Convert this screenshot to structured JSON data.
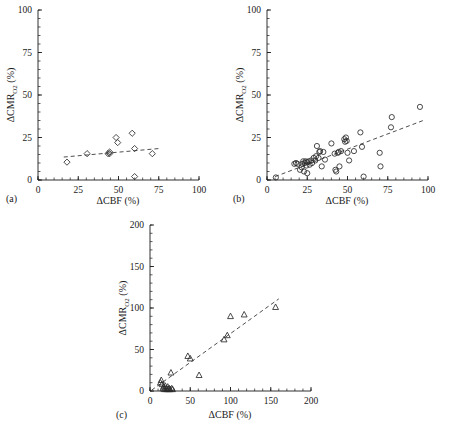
{
  "figure": {
    "background": "#ffffff",
    "ink": "#1a1a1a",
    "marker_color": "#2b2b2b",
    "trend_color": "#3a3a3a"
  },
  "panels": [
    {
      "tag": "(a)",
      "xlabel_main": "ΔCBF (%)",
      "ylabel_main": "ΔCMR",
      "ylabel_sub": "O2",
      "ylabel_unit": " (%)",
      "xticks": [
        "0",
        "25",
        "50",
        "75",
        "100"
      ],
      "yticks": [
        "0",
        "25",
        "50",
        "75",
        "100"
      ]
    },
    {
      "tag": "(b)",
      "xlabel_main": "ΔCBF (%)",
      "ylabel_main": "ΔCMR",
      "ylabel_sub": "O2",
      "ylabel_unit": " (%)",
      "xticks": [
        "0",
        "25",
        "50",
        "75",
        "100"
      ],
      "yticks": [
        "0",
        "25",
        "50",
        "75",
        "100"
      ]
    },
    {
      "tag": "(c)",
      "xlabel_main": "ΔCBF (%)",
      "ylabel_main": "ΔCMR",
      "ylabel_sub": "O2",
      "ylabel_unit": " (%)",
      "xticks": [
        "0",
        "50",
        "100",
        "150",
        "200"
      ],
      "yticks": [
        "0",
        "50",
        "100",
        "150",
        "200"
      ]
    }
  ],
  "chart_data": [
    {
      "type": "scatter",
      "panel": "a",
      "title": "",
      "xlabel": "ΔCBF (%)",
      "ylabel": "ΔCMR_O2 (%)",
      "xlim": [
        0,
        100
      ],
      "ylim": [
        0,
        100
      ],
      "xticks": [
        0,
        25,
        50,
        75,
        100
      ],
      "yticks": [
        0,
        25,
        50,
        75,
        100
      ],
      "grid": false,
      "legend": "none",
      "marker": "diamond",
      "points": [
        {
          "x": 18,
          "y": 10.5
        },
        {
          "x": 30.5,
          "y": 15.5
        },
        {
          "x": 43.5,
          "y": 15.5
        },
        {
          "x": 44.5,
          "y": 15.5
        },
        {
          "x": 44.5,
          "y": 16.5
        },
        {
          "x": 48.5,
          "y": 25
        },
        {
          "x": 49.5,
          "y": 22
        },
        {
          "x": 58.5,
          "y": 27.5
        },
        {
          "x": 60,
          "y": 18.5
        },
        {
          "x": 60,
          "y": 2
        },
        {
          "x": 71,
          "y": 15.5
        }
      ],
      "trendline": {
        "x0": 16,
        "y0": 13.5,
        "x1": 75,
        "y1": 18.5,
        "style": "dashed"
      }
    },
    {
      "type": "scatter",
      "panel": "b",
      "title": "",
      "xlabel": "ΔCBF (%)",
      "ylabel": "ΔCMR_O2 (%)",
      "xlim": [
        0,
        100
      ],
      "ylim": [
        0,
        100
      ],
      "xticks": [
        0,
        25,
        50,
        75,
        100
      ],
      "yticks": [
        0,
        25,
        50,
        75,
        100
      ],
      "grid": false,
      "legend": "none",
      "marker": "circle",
      "points": [
        {
          "x": 5.5,
          "y": 1.5
        },
        {
          "x": 17,
          "y": 9.5
        },
        {
          "x": 18,
          "y": 10
        },
        {
          "x": 19,
          "y": 9.5
        },
        {
          "x": 20.5,
          "y": 6
        },
        {
          "x": 21.5,
          "y": 7.5
        },
        {
          "x": 22,
          "y": 9.5
        },
        {
          "x": 22.5,
          "y": 11
        },
        {
          "x": 23,
          "y": 5
        },
        {
          "x": 23.5,
          "y": 10
        },
        {
          "x": 24,
          "y": 11
        },
        {
          "x": 24.5,
          "y": 8.5
        },
        {
          "x": 25,
          "y": 10.5
        },
        {
          "x": 25,
          "y": 4
        },
        {
          "x": 26,
          "y": 11
        },
        {
          "x": 26.5,
          "y": 9
        },
        {
          "x": 27.5,
          "y": 11.5
        },
        {
          "x": 28,
          "y": 10
        },
        {
          "x": 29,
          "y": 13
        },
        {
          "x": 30,
          "y": 11.5
        },
        {
          "x": 30.5,
          "y": 14
        },
        {
          "x": 31,
          "y": 20
        },
        {
          "x": 32,
          "y": 13
        },
        {
          "x": 32.5,
          "y": 16.5
        },
        {
          "x": 33,
          "y": 17
        },
        {
          "x": 34,
          "y": 8
        },
        {
          "x": 35,
          "y": 16.5
        },
        {
          "x": 36,
          "y": 12
        },
        {
          "x": 40,
          "y": 21.5
        },
        {
          "x": 42,
          "y": 15.5
        },
        {
          "x": 42.5,
          "y": 6
        },
        {
          "x": 43,
          "y": 5
        },
        {
          "x": 44,
          "y": 16
        },
        {
          "x": 44.5,
          "y": 16.5
        },
        {
          "x": 45,
          "y": 8
        },
        {
          "x": 46,
          "y": 17
        },
        {
          "x": 48,
          "y": 24
        },
        {
          "x": 48.5,
          "y": 22.5
        },
        {
          "x": 49,
          "y": 25
        },
        {
          "x": 49.5,
          "y": 23
        },
        {
          "x": 50,
          "y": 16
        },
        {
          "x": 51,
          "y": 11.5
        },
        {
          "x": 54,
          "y": 17
        },
        {
          "x": 58,
          "y": 28
        },
        {
          "x": 59,
          "y": 19.5
        },
        {
          "x": 60,
          "y": 2
        },
        {
          "x": 70,
          "y": 16
        },
        {
          "x": 70.5,
          "y": 8
        },
        {
          "x": 77,
          "y": 31
        },
        {
          "x": 77.5,
          "y": 37
        },
        {
          "x": 95,
          "y": 43
        }
      ],
      "trendline": {
        "x0": 5,
        "y0": 2,
        "x1": 97,
        "y1": 35,
        "style": "dashed"
      }
    },
    {
      "type": "scatter",
      "panel": "c",
      "title": "",
      "xlabel": "ΔCBF (%)",
      "ylabel": "ΔCMR_O2 (%)",
      "xlim": [
        0,
        200
      ],
      "ylim": [
        0,
        200
      ],
      "xticks": [
        0,
        50,
        100,
        150,
        200
      ],
      "yticks": [
        0,
        50,
        100,
        150,
        200
      ],
      "grid": false,
      "legend": "none",
      "marker": "triangle",
      "points": [
        {
          "x": 13,
          "y": 10
        },
        {
          "x": 14,
          "y": 13
        },
        {
          "x": 15,
          "y": 8
        },
        {
          "x": 16,
          "y": 3
        },
        {
          "x": 17,
          "y": 5
        },
        {
          "x": 18,
          "y": 2
        },
        {
          "x": 19,
          "y": 6
        },
        {
          "x": 20,
          "y": 3
        },
        {
          "x": 21,
          "y": 2
        },
        {
          "x": 22,
          "y": 5
        },
        {
          "x": 23,
          "y": 2
        },
        {
          "x": 24,
          "y": 3
        },
        {
          "x": 25,
          "y": 2
        },
        {
          "x": 26,
          "y": 22
        },
        {
          "x": 27,
          "y": 3
        },
        {
          "x": 28,
          "y": 2
        },
        {
          "x": 47,
          "y": 42
        },
        {
          "x": 50,
          "y": 39
        },
        {
          "x": 61,
          "y": 19
        },
        {
          "x": 92,
          "y": 62
        },
        {
          "x": 96,
          "y": 67
        },
        {
          "x": 100,
          "y": 90
        },
        {
          "x": 117,
          "y": 92
        },
        {
          "x": 156,
          "y": 101
        }
      ],
      "trendline": {
        "x0": 2,
        "y0": 1,
        "x1": 160,
        "y1": 111,
        "style": "dashed"
      }
    }
  ]
}
